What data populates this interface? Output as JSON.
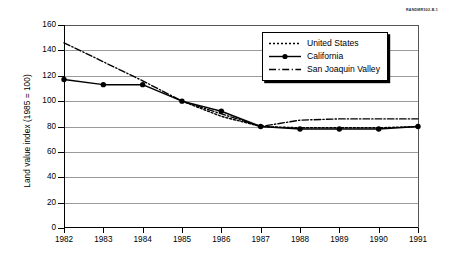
{
  "source_tag": "RANDMR502-B.1",
  "chart_data": {
    "type": "line",
    "title": "",
    "xlabel": "",
    "ylabel": "Land value index (1985 = 100)",
    "x": [
      1982,
      1983,
      1984,
      1985,
      1986,
      1987,
      1988,
      1989,
      1990,
      1991
    ],
    "xtick_labels": [
      "1982",
      "1983",
      "1984",
      "1985",
      "1986",
      "1987",
      "1988",
      "1989",
      "1990",
      "1991"
    ],
    "xlim": [
      1982,
      1991
    ],
    "ylim": [
      0,
      160
    ],
    "ytick_labels": [
      "0",
      "20",
      "40",
      "60",
      "80",
      "100",
      "120",
      "140",
      "160"
    ],
    "yticks": [
      0,
      20,
      40,
      60,
      80,
      100,
      120,
      140,
      160
    ],
    "grid": true,
    "grid_axis": "y",
    "legend_position": "upper right",
    "series": [
      {
        "name": "United States",
        "style": "dotted",
        "marker": "none",
        "color": "#000000",
        "x": [
          1985,
          1986,
          1987,
          1988,
          1989,
          1990,
          1991
        ],
        "values": [
          100,
          88,
          80,
          79,
          79,
          79,
          80
        ]
      },
      {
        "name": "California",
        "style": "solid",
        "marker": "filled-circle",
        "color": "#000000",
        "x": [
          1982,
          1983,
          1984,
          1985,
          1986,
          1987,
          1988,
          1989,
          1990,
          1991
        ],
        "values": [
          117,
          113,
          113,
          100,
          92,
          80,
          78,
          78,
          78,
          80
        ]
      },
      {
        "name": "San Joaquin Valley",
        "style": "dash-dot",
        "marker": "none",
        "color": "#000000",
        "x": [
          1982,
          1983,
          1984,
          1985,
          1986,
          1987,
          1988,
          1989,
          1990,
          1991
        ],
        "values": [
          146,
          131,
          116,
          100,
          90,
          80,
          85,
          86,
          86,
          86
        ]
      }
    ]
  },
  "legend": {
    "items": [
      {
        "label": "United States"
      },
      {
        "label": "California"
      },
      {
        "label": "San Joaquin Valley"
      }
    ]
  }
}
